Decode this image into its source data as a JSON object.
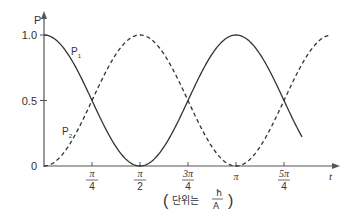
{
  "chart_data": {
    "type": "line",
    "title": "",
    "xlabel": "t",
    "ylabel": "P",
    "unit_note": {
      "prefix": "단위는",
      "fraction_numerator": "ħ",
      "fraction_denominator": "A"
    },
    "ylim": [
      0,
      1.0
    ],
    "xlim": [
      0,
      1.25
    ],
    "x_units": "π",
    "y_ticks": [
      {
        "value": 0,
        "label": "0"
      },
      {
        "value": 0.5,
        "label": "0.5"
      },
      {
        "value": 1.0,
        "label": "1.0"
      }
    ],
    "x_ticks": [
      {
        "value": 0.25,
        "num": "π",
        "den": "4"
      },
      {
        "value": 0.5,
        "num": "π",
        "den": "2"
      },
      {
        "value": 0.75,
        "num": "3π",
        "den": "4"
      },
      {
        "value": 1.0,
        "num": "π",
        "den": ""
      },
      {
        "value": 1.25,
        "num": "5π",
        "den": "4"
      }
    ],
    "axis_end_label": "t",
    "grid": false,
    "series": [
      {
        "name": "P1",
        "label_main": "P",
        "label_sub": "1",
        "style": "solid",
        "formula": "cos^2(t)",
        "x": [
          0,
          0.125,
          0.25,
          0.375,
          0.5,
          0.625,
          0.75,
          0.875,
          1.0,
          1.125,
          1.25,
          1.375
        ],
        "values": [
          1.0,
          0.854,
          0.5,
          0.146,
          0.0,
          0.146,
          0.5,
          0.854,
          1.0,
          0.854,
          0.5,
          0.146
        ]
      },
      {
        "name": "P2",
        "label_main": "P",
        "label_sub": "2",
        "style": "dashed",
        "formula": "sin^2(t)",
        "x": [
          0,
          0.125,
          0.25,
          0.375,
          0.5,
          0.625,
          0.75,
          0.875,
          1.0,
          1.125,
          1.25,
          1.375,
          1.5
        ],
        "values": [
          0.0,
          0.146,
          0.5,
          0.854,
          1.0,
          0.854,
          0.5,
          0.146,
          0.0,
          0.146,
          0.5,
          0.854,
          1.0
        ]
      }
    ],
    "colors": {
      "line": "#333333",
      "axis": "#555555"
    }
  }
}
